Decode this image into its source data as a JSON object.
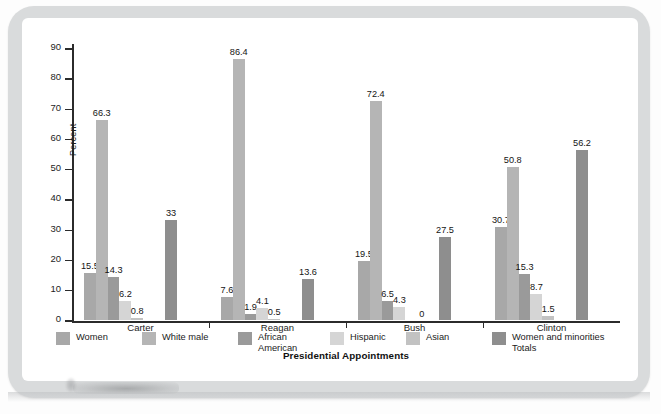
{
  "chart_data": {
    "type": "bar",
    "title": "",
    "xlabel": "Presidential Appointments",
    "ylabel": "Percent",
    "ylim": [
      0,
      90
    ],
    "ytick_step": 10,
    "yticks": [
      90,
      80,
      70,
      60,
      50,
      40,
      30,
      20,
      10,
      0
    ],
    "grid": false,
    "legend_position": "bottom",
    "categories": [
      "Carter",
      "Reagan",
      "Bush",
      "Clinton"
    ],
    "series": [
      {
        "name": "Women",
        "color": "#a8a8a8",
        "values": [
          15.5,
          7.6,
          19.5,
          30.7
        ],
        "labels": [
          "15.5",
          "7.6",
          "19.5",
          "30.7"
        ]
      },
      {
        "name": "White male",
        "color": "#b5b5b5",
        "values": [
          66.3,
          86.4,
          72.4,
          50.8
        ],
        "labels": [
          "66.3",
          "86.4",
          "72.4",
          "50.8"
        ]
      },
      {
        "name": "African\nAmerican",
        "color": "#9a9a9a",
        "values": [
          14.3,
          1.9,
          6.5,
          15.3
        ],
        "labels": [
          "14.3",
          "1.9",
          "6.5",
          "15.3"
        ]
      },
      {
        "name": "Hispanic",
        "color": "#d5d5d5",
        "values": [
          6.2,
          4.1,
          4.3,
          8.7
        ],
        "labels": [
          "6.2",
          "4.1",
          "4.3",
          "8.7"
        ]
      },
      {
        "name": "Asian",
        "color": "#c2c2c2",
        "values": [
          0.8,
          0.5,
          0,
          1.5
        ],
        "labels": [
          "0.8",
          "0.5",
          "0",
          "1.5"
        ]
      },
      {
        "name": "Women and minorities\nTotals",
        "color": "#8e8e8e",
        "values": [
          33,
          13.6,
          27.5,
          56.2
        ],
        "labels": [
          "33",
          "13.6",
          "27.5",
          "56.2"
        ]
      }
    ]
  },
  "legend": {
    "items": [
      {
        "label": "Women",
        "color": "#a8a8a8"
      },
      {
        "label": "White male",
        "color": "#b5b5b5"
      },
      {
        "label": "African\nAmerican",
        "color": "#9a9a9a"
      },
      {
        "label": "Hispanic",
        "color": "#d5d5d5"
      },
      {
        "label": "Asian",
        "color": "#c2c2c2"
      },
      {
        "label": "Women and minorities\nTotals",
        "color": "#8e8e8e"
      }
    ]
  },
  "frame": {
    "border_color": "#d9dbdc",
    "background_color": "#ffffff",
    "axis_color": "#2b2b2b"
  }
}
